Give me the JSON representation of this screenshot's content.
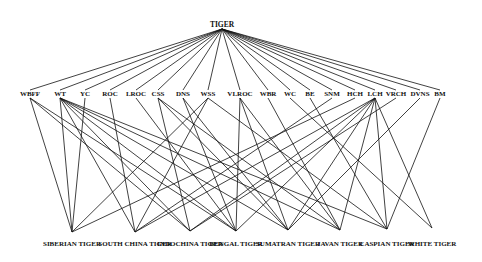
{
  "diagram": {
    "type": "hierarchy",
    "root": {
      "id": "TIGER",
      "label": "TIGER",
      "x": 222,
      "y": 27
    },
    "attributes": [
      {
        "id": "WBFF",
        "label": "WBFF",
        "x": 30,
        "y": 96
      },
      {
        "id": "WT",
        "label": "WT",
        "x": 60,
        "y": 96
      },
      {
        "id": "YC",
        "label": "YC",
        "x": 85,
        "y": 96
      },
      {
        "id": "ROC",
        "label": "ROC",
        "x": 110,
        "y": 96
      },
      {
        "id": "LROC",
        "label": "LROC",
        "x": 136,
        "y": 96
      },
      {
        "id": "CSS",
        "label": "CSS",
        "x": 158,
        "y": 96
      },
      {
        "id": "DNS",
        "label": "DNS",
        "x": 183,
        "y": 96
      },
      {
        "id": "WSS",
        "label": "WSS",
        "x": 208,
        "y": 96
      },
      {
        "id": "VLROC",
        "label": "VLROC",
        "x": 240,
        "y": 96
      },
      {
        "id": "WBR",
        "label": "WBR",
        "x": 268,
        "y": 96
      },
      {
        "id": "WC",
        "label": "WC",
        "x": 290,
        "y": 96
      },
      {
        "id": "BE",
        "label": "BE",
        "x": 310,
        "y": 96
      },
      {
        "id": "SNM",
        "label": "SNM",
        "x": 332,
        "y": 96
      },
      {
        "id": "HCH",
        "label": "HCH",
        "x": 355,
        "y": 96
      },
      {
        "id": "LCH",
        "label": "LCH",
        "x": 375,
        "y": 96
      },
      {
        "id": "VRCH",
        "label": "VRCH",
        "x": 396,
        "y": 96
      },
      {
        "id": "DVNS",
        "label": "DVNS",
        "x": 420,
        "y": 96
      },
      {
        "id": "BM",
        "label": "BM",
        "x": 440,
        "y": 96
      }
    ],
    "species": [
      {
        "id": "SIBERIAN",
        "label": "SIBERIAN TIGER",
        "x": 72,
        "y": 232
      },
      {
        "id": "SOUTH_CHINA",
        "label": "SOUTH CHINA TIGER",
        "x": 135,
        "y": 232
      },
      {
        "id": "INDOCHINA",
        "label": "INDOCHINA TIGER",
        "x": 190,
        "y": 231
      },
      {
        "id": "BENGAL",
        "label": "BENGAL TIGER",
        "x": 236,
        "y": 231
      },
      {
        "id": "SUMATRAN",
        "label": "SUMATRAN TIGER",
        "x": 288,
        "y": 230
      },
      {
        "id": "JAVAN",
        "label": "JAVAN TIGER",
        "x": 340,
        "y": 230
      },
      {
        "id": "CASPIAN",
        "label": "CASPIAN TIGER",
        "x": 387,
        "y": 229
      },
      {
        "id": "WHITE",
        "label": "WHITE TIGER",
        "x": 432,
        "y": 228
      }
    ],
    "edges": [
      [
        "WBFF",
        "SIBERIAN"
      ],
      [
        "WBFF",
        "INDOCHINA"
      ],
      [
        "WBFF",
        "BENGAL"
      ],
      [
        "WT",
        "SIBERIAN"
      ],
      [
        "WT",
        "SOUTH_CHINA"
      ],
      [
        "WT",
        "INDOCHINA"
      ],
      [
        "WT",
        "BENGAL"
      ],
      [
        "WT",
        "SUMATRAN"
      ],
      [
        "WT",
        "JAVAN"
      ],
      [
        "WT",
        "CASPIAN"
      ],
      [
        "YC",
        "SIBERIAN"
      ],
      [
        "ROC",
        "SOUTH_CHINA"
      ],
      [
        "LROC",
        "BENGAL"
      ],
      [
        "CSS",
        "INDOCHINA"
      ],
      [
        "CSS",
        "SUMATRAN"
      ],
      [
        "CSS",
        "JAVAN"
      ],
      [
        "DNS",
        "BENGAL"
      ],
      [
        "DNS",
        "SUMATRAN"
      ],
      [
        "WSS",
        "SIBERIAN"
      ],
      [
        "WSS",
        "SOUTH_CHINA"
      ],
      [
        "WSS",
        "CASPIAN"
      ],
      [
        "VLROC",
        "BENGAL"
      ],
      [
        "VLROC",
        "SUMATRAN"
      ],
      [
        "VLROC",
        "JAVAN"
      ],
      [
        "WBR",
        "JAVAN"
      ],
      [
        "WC",
        "WHITE"
      ],
      [
        "BE",
        "CASPIAN"
      ],
      [
        "SNM",
        "SOUTH_CHINA"
      ],
      [
        "HCH",
        "SIBERIAN"
      ],
      [
        "LCH",
        "SOUTH_CHINA"
      ],
      [
        "LCH",
        "INDOCHINA"
      ],
      [
        "LCH",
        "BENGAL"
      ],
      [
        "LCH",
        "SUMATRAN"
      ],
      [
        "LCH",
        "JAVAN"
      ],
      [
        "LCH",
        "CASPIAN"
      ],
      [
        "LCH",
        "WHITE"
      ],
      [
        "VRCH",
        "INDOCHINA"
      ],
      [
        "DVNS",
        "SUMATRAN"
      ],
      [
        "BM",
        "CASPIAN"
      ]
    ]
  }
}
